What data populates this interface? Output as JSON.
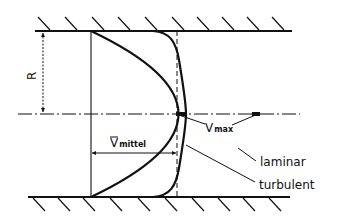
{
  "diagram": {
    "type": "pipe-flow-velocity-profile",
    "labels": {
      "radius": "R",
      "mean_velocity_symbol": "V",
      "mean_velocity_subscript": "mittel",
      "max_velocity_symbol": "V",
      "max_velocity_subscript": "max",
      "laminar": "laminar",
      "turbulent": "turbulent"
    },
    "elements": [
      "upper-pipe-wall",
      "lower-pipe-wall",
      "centerline",
      "laminar-profile",
      "turbulent-profile",
      "mean-velocity-dimension",
      "radius-dimension"
    ],
    "colors": {
      "line": "#111111",
      "background": "#ffffff"
    }
  }
}
